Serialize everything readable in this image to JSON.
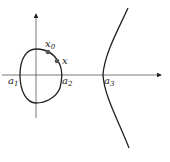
{
  "diagram": {
    "axes": {
      "x_axis": "horizontal with arrow",
      "y_axis": "vertical with arrow"
    },
    "labels": {
      "a1": {
        "base": "a",
        "sub": "1"
      },
      "a2": {
        "base": "a",
        "sub": "2"
      },
      "a3": {
        "base": "a",
        "sub": "3"
      },
      "x0": {
        "base": "x",
        "sub": "0"
      },
      "x": {
        "base": "x",
        "sub": ""
      }
    },
    "points": [
      "x0",
      "x"
    ],
    "colors": {
      "stroke": "#222222",
      "axis": "#555555",
      "point": "#555555"
    }
  }
}
